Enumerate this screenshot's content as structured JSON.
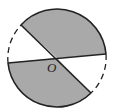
{
  "diagram": {
    "type": "circle-sectors",
    "center_label": "O",
    "circle": {
      "cx": 57,
      "cy": 58,
      "r": 49
    },
    "diameters": [
      {
        "from": [
          8,
          63
        ],
        "to": [
          106,
          54
        ]
      },
      {
        "from": [
          21,
          26
        ],
        "to": [
          91,
          97
        ]
      }
    ],
    "shaded_sectors": [
      "top-right",
      "bottom-left"
    ],
    "dashed_arcs": [
      "left",
      "right"
    ],
    "colors": {
      "shade": "#a9a9a9",
      "stroke": "#222222",
      "background": "#ffffff"
    }
  }
}
